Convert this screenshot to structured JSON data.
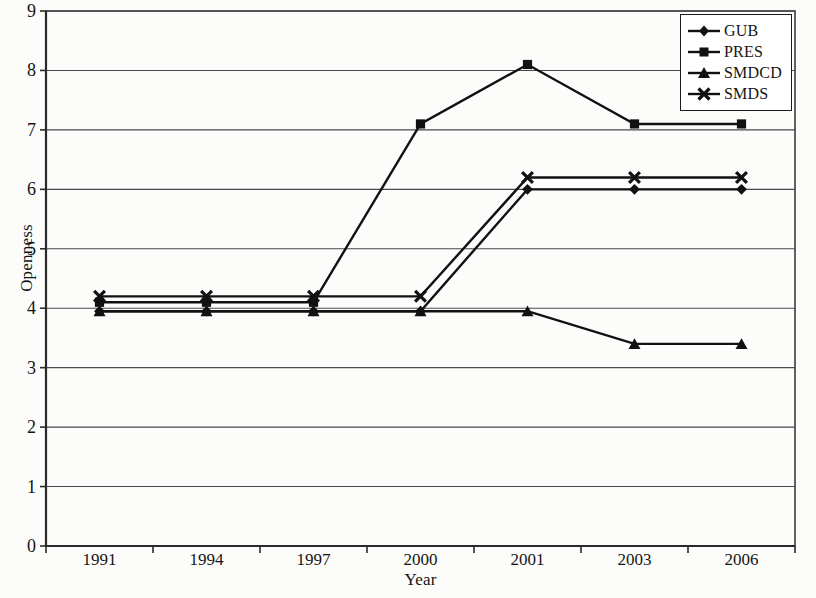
{
  "chart_data": {
    "type": "line",
    "title": "",
    "xlabel": "Year",
    "ylabel": "Openness",
    "categories": [
      "1991",
      "1994",
      "1997",
      "2000",
      "2001",
      "2003",
      "2006"
    ],
    "ylim": [
      0,
      9
    ],
    "yticks": [
      0,
      1,
      2,
      3,
      4,
      5,
      6,
      7,
      8,
      9
    ],
    "grid": "horizontal",
    "legend_position": "top-right",
    "series": [
      {
        "name": "GUB",
        "marker": "diamond",
        "color": "#111111",
        "values": [
          3.95,
          3.95,
          3.95,
          3.95,
          6.0,
          6.0,
          6.0
        ]
      },
      {
        "name": "PRES",
        "marker": "square",
        "color": "#111111",
        "values": [
          4.1,
          4.1,
          4.1,
          7.1,
          8.1,
          7.1,
          7.1
        ]
      },
      {
        "name": "SMDCD",
        "marker": "triangle",
        "color": "#111111",
        "values": [
          3.95,
          3.95,
          3.95,
          3.95,
          3.95,
          3.4,
          3.4
        ]
      },
      {
        "name": "SMDS",
        "marker": "x",
        "color": "#111111",
        "values": [
          4.2,
          4.2,
          4.2,
          4.2,
          6.2,
          6.2,
          6.2
        ]
      }
    ]
  },
  "axes": {
    "y_title": "Openness",
    "x_title": "Year",
    "y_tick_labels": [
      "9",
      "8",
      "7",
      "6",
      "5",
      "4",
      "3",
      "2",
      "1",
      "0"
    ],
    "x_tick_labels": [
      "1991",
      "1994",
      "1997",
      "2000",
      "2001",
      "2003",
      "2006"
    ]
  },
  "legend": {
    "items": [
      {
        "label": "GUB",
        "marker": "diamond-marker-icon"
      },
      {
        "label": "PRES",
        "marker": "square-marker-icon"
      },
      {
        "label": "SMDCD",
        "marker": "triangle-marker-icon"
      },
      {
        "label": "SMDS",
        "marker": "x-marker-icon"
      }
    ]
  }
}
